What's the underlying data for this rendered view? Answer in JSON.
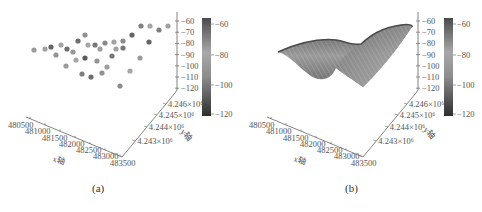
{
  "figure": {
    "captions": [
      "(a)",
      "(b)"
    ]
  },
  "chart_data": [
    {
      "type": "scatter",
      "panel": "(a)",
      "title": "",
      "xlabel": "x轴",
      "ylabel": "y轴",
      "zlabel": "",
      "x_ticks": [
        "480500",
        "481000",
        "481500",
        "482000",
        "482500",
        "483000",
        "483500"
      ],
      "y_ticks": [
        "4.243×10⁶",
        "4.244×10⁶",
        "4.245×10⁶",
        "4.246×10⁶"
      ],
      "z_ticks": [
        "-60",
        "-70",
        "-80",
        "-90",
        "-100",
        "-110",
        "-120"
      ],
      "zlim": [
        -120,
        -60
      ],
      "colorbar": {
        "ticks": [
          "-60",
          "-80",
          "-100",
          "-120"
        ],
        "range": [
          -120,
          -60
        ],
        "colormap": "gray"
      },
      "points_screen": [
        [
          34,
          50,
          -78
        ],
        [
          45,
          49,
          -85
        ],
        [
          51,
          47,
          -66
        ],
        [
          61,
          45,
          -80
        ],
        [
          67,
          49,
          -68
        ],
        [
          73,
          52,
          -90
        ],
        [
          56,
          55,
          -92
        ],
        [
          78,
          41,
          -68
        ],
        [
          85,
          35,
          -94
        ],
        [
          88,
          45,
          -82
        ],
        [
          95,
          45,
          -70
        ],
        [
          100,
          49,
          -86
        ],
        [
          105,
          43,
          -74
        ],
        [
          114,
          42,
          -80
        ],
        [
          123,
          41,
          -96
        ],
        [
          116,
          49,
          -84
        ],
        [
          123,
          48,
          -70
        ],
        [
          132,
          35,
          -66
        ],
        [
          141,
          26,
          -72
        ],
        [
          150,
          26,
          -82
        ],
        [
          159,
          30,
          -72
        ],
        [
          168,
          26,
          -86
        ],
        [
          149,
          42,
          -66
        ],
        [
          85,
          58,
          -64
        ],
        [
          76,
          60,
          -82
        ],
        [
          97,
          61,
          -92
        ],
        [
          112,
          56,
          -70
        ],
        [
          140,
          58,
          -78
        ],
        [
          66,
          66,
          -88
        ],
        [
          107,
          67,
          -86
        ],
        [
          82,
          74,
          -72
        ],
        [
          91,
          77,
          -68
        ],
        [
          102,
          73,
          -76
        ],
        [
          130,
          71,
          -82
        ],
        [
          120,
          86,
          -96
        ]
      ]
    },
    {
      "type": "surface",
      "panel": "(b)",
      "title": "",
      "xlabel": "x轴",
      "ylabel": "y轴",
      "zlabel": "",
      "x_ticks": [
        "480500",
        "481000",
        "481500",
        "482000",
        "482500",
        "483000",
        "483500"
      ],
      "y_ticks": [
        "4.243×10⁶",
        "4.244×10⁶",
        "4.245×10⁶",
        "4.246×10⁶"
      ],
      "z_ticks": [
        "-60",
        "-70",
        "-80",
        "-90",
        "-100",
        "-110",
        "-120"
      ],
      "zlim": [
        -120,
        -60
      ],
      "colorbar": {
        "ticks": [
          "-60",
          "-80",
          "-100",
          "-120"
        ],
        "range": [
          -120,
          -60
        ],
        "colormap": "gray"
      },
      "description": "Interpolated wireframe surface with two peaks along back edge and trough toward front-left"
    }
  ]
}
